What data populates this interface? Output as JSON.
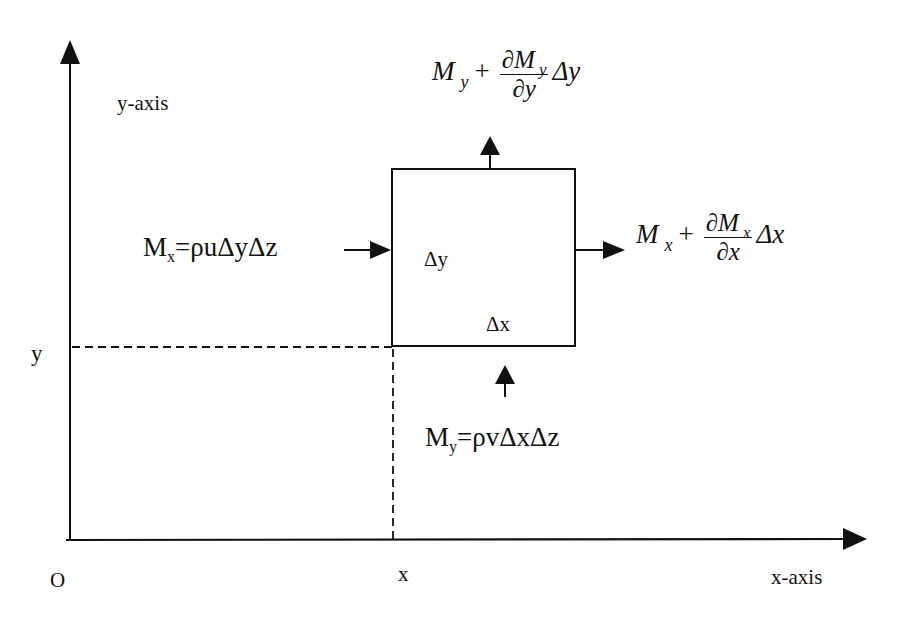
{
  "diagram": {
    "axes": {
      "origin_label": "O",
      "x_axis_label": "x-axis",
      "y_axis_label": "y-axis",
      "x_position_label": "x",
      "y_position_label": "y"
    },
    "control_volume": {
      "dx_label": "Δx",
      "dy_label": "Δy"
    },
    "fluxes": {
      "inflow_x": {
        "symbol": "M",
        "subscript": "x",
        "equals": "=ρuΔyΔz",
        "direction": "right-into-left-face"
      },
      "outflow_x": {
        "symbol": "M",
        "subscript": "x",
        "plus": "+",
        "numerator": "∂M",
        "numerator_sub": "x",
        "denominator": "∂x",
        "trailing": "Δx",
        "direction": "right-out-of-right-face"
      },
      "inflow_y": {
        "symbol": "M",
        "subscript": "y",
        "equals": "=ρvΔxΔz",
        "direction": "up-into-bottom-face"
      },
      "outflow_y": {
        "symbol": "M",
        "subscript": "y",
        "plus": "+",
        "numerator": "∂M",
        "numerator_sub": "y",
        "denominator": "∂y",
        "trailing": "Δy",
        "direction": "up-out-of-top-face"
      }
    },
    "colors": {
      "ink": "#111111",
      "background": "#ffffff"
    }
  }
}
